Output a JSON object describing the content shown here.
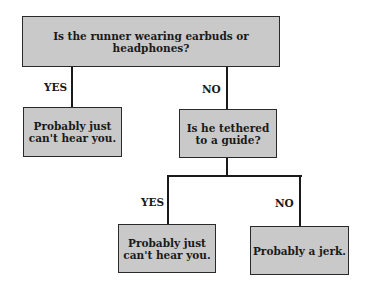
{
  "flowchart": {
    "root": {
      "text": "Is the runner wearing earbuds or headphones?"
    },
    "branch_yes_label": "YES",
    "branch_no_label": "NO",
    "left_result": {
      "text": "Probably just\ncan't hear you."
    },
    "middle_question": {
      "text": "Is he tethered\nto a guide?"
    },
    "sub_yes_label": "YES",
    "sub_no_label": "NO",
    "sub_yes_result": {
      "text": "Probably just\ncan't hear you."
    },
    "sub_no_result": {
      "text": "Probably a jerk."
    }
  },
  "colors": {
    "box_fill": "#c9c9c9",
    "line": "#1a1a1a"
  }
}
